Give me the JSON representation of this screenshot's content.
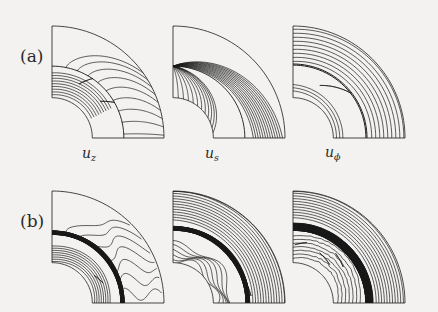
{
  "figure": {
    "type": "contour-plot-grid",
    "background_color": "#f3f2f0",
    "line_color": "#1a1a1a",
    "rows": 2,
    "columns": 3,
    "row_labels": [
      "(a)",
      "(b)"
    ],
    "column_labels": [
      {
        "base": "u",
        "sub": "z",
        "text": "u_z"
      },
      {
        "base": "u",
        "sub": "s",
        "text": "u_s"
      },
      {
        "base": "u",
        "sub": "ϕ",
        "text": "u_phi"
      }
    ]
  },
  "chart_data": {
    "type": "contour",
    "title": "",
    "xlabel": "",
    "ylabel": "",
    "grid": false,
    "legend": null,
    "domain": {
      "shape": "meridional-quarter-annulus",
      "description": "Quarter annular sector: inner quarter-circle arc at lower-left, outer quarter-circle arc at upper-right, flat left edge and flat bottom edge",
      "inner_radius": 0.35,
      "outer_radius": 1.0,
      "angle_range_deg": [
        0,
        90
      ]
    },
    "panels": [
      {
        "row": "(a)",
        "column": "u_z",
        "label": "u_z",
        "contour_count": 22,
        "structure": "near-vertical closely spaced contours in left portion, broad fan of arcs sweeping from upper-left to lower-right; two small closed cusp features along the vertical mid-line",
        "dark_band": false,
        "cusps": 2
      },
      {
        "row": "(a)",
        "column": "u_s",
        "label": "u_s",
        "contour_count": 26,
        "structure": "contours converging on a single node at the top of the vertical mid-line; left region arcs curve down-left, right region arcs sweep down to the bottom edge",
        "dark_band": false,
        "cusps": 0
      },
      {
        "row": "(a)",
        "column": "u_phi",
        "label": "u_ϕ",
        "contour_count": 16,
        "structure": "sparse curved contours in left region, a strong vertical line at the mid-line, then near-vertical contours fanning to the right toward the outer arc",
        "dark_band": false,
        "cusps": 1
      },
      {
        "row": "(b)",
        "column": "u_z",
        "label": "u_z",
        "contour_count": 34,
        "structure": "dense dark vertical shear band just left of the mid-line; to the right a family of wavy horizontal arcs with pronounced undulations sweeping to the outer arc",
        "dark_band": true,
        "dark_band_position": 0.42,
        "cusps": 1
      },
      {
        "row": "(b)",
        "column": "u_s",
        "label": "u_s",
        "contour_count": 38,
        "structure": "dense dark vertical band on the mid-line; to the left strongly wavy nested contours with repeating lobes; to the right near-vertical contours bending to the bottom edge",
        "dark_band": true,
        "dark_band_position": 0.48,
        "cusps": 0
      },
      {
        "row": "(b)",
        "column": "u_phi",
        "label": "u_ϕ",
        "contour_count": 40,
        "structure": "very dense dark vertical band near the mid-line; narrow spike-like contours on both sides; near-vertical contours fanning right toward the outer arc",
        "dark_band": true,
        "dark_band_position": 0.5,
        "cusps": 2
      }
    ]
  }
}
